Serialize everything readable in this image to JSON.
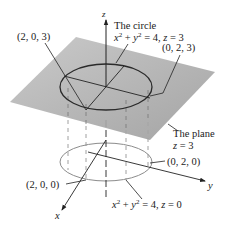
{
  "figure": {
    "axes": {
      "x_label": "x",
      "y_label": "y",
      "z_label": "z"
    },
    "top_circle": {
      "title": "The circle",
      "eq_x": "x",
      "eq_plus": " + ",
      "eq_y": "y",
      "eq_rest": " = 4, ",
      "eq_z": "z",
      "eq_end": " = 3",
      "exp": "2"
    },
    "plane": {
      "title": "The plane",
      "eq_z": "z",
      "eq_end": " = 3"
    },
    "bottom_circle": {
      "eq_x": "x",
      "eq_plus": " + ",
      "eq_y": "y",
      "eq_rest": " = 4, ",
      "eq_z": "z",
      "eq_end": " = 0",
      "exp": "2"
    },
    "points": {
      "p203": "(2, 0, 3)",
      "p023": "(0, 2, 3)",
      "p020": "(0, 2, 0)",
      "p200": "(2, 0, 0)"
    },
    "colors": {
      "plane": "#a9a9a9",
      "top_circle": "#2a2a2a",
      "bottom_circle": "#8c8c8c",
      "lines": "#222222"
    }
  }
}
